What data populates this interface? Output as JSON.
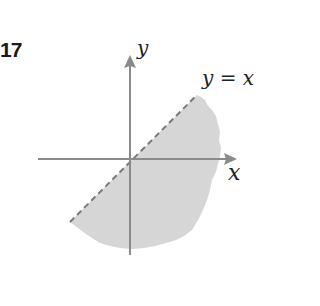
{
  "problem": {
    "number": "17"
  },
  "figure": {
    "x_axis_label": "x",
    "y_axis_label": "y",
    "boundary_label": "y = x",
    "boundary_style": "dashed",
    "shaded_region": "below the line y = x",
    "colors": {
      "axis": "#8a8a8a",
      "region": "#d6d6d6",
      "boundary": "#7a7a7a"
    }
  }
}
